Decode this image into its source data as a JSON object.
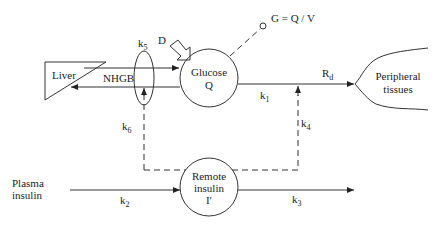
{
  "diagram": {
    "nodes": {
      "liver": {
        "label": "Liver"
      },
      "glucose": {
        "line1": "Glucose",
        "line2": "Q"
      },
      "remote_insulin": {
        "line1": "Remote",
        "line2": "insulin",
        "line3": "I′"
      },
      "peripheral": {
        "line1": "Peripheral",
        "line2": "tissues"
      },
      "plasma_insulin": {
        "line1": "Plasma",
        "line2": "insulin"
      },
      "measurement": {
        "label": "G = Q / V"
      }
    },
    "labels": {
      "nhgb": "NHGB",
      "dose": "D",
      "rd": {
        "base": "R",
        "sub": "d"
      },
      "k1": {
        "base": "k",
        "sub": "1"
      },
      "k2": {
        "base": "k",
        "sub": "2"
      },
      "k3": {
        "base": "k",
        "sub": "3"
      },
      "k4": {
        "base": "k",
        "sub": "4"
      },
      "k5": {
        "base": "k",
        "sub": "5"
      },
      "k6": {
        "base": "k",
        "sub": "6"
      }
    },
    "colors": {
      "stroke": "#333333",
      "text": "#222222",
      "background": "#ffffff"
    }
  }
}
